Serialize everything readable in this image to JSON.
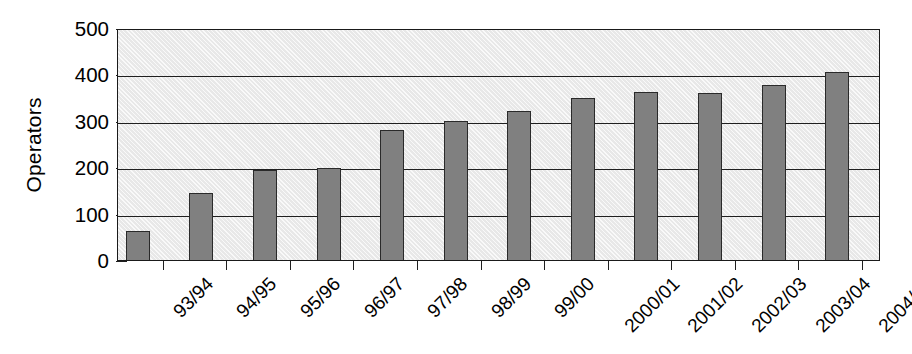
{
  "chart_data": {
    "type": "bar",
    "title": "",
    "subtitle": "",
    "xlabel": "",
    "ylabel": "Operators",
    "categories": [
      "93/94",
      "94/95",
      "95/96",
      "96/97",
      "97/98",
      "98/99",
      "99/00",
      "2000/01",
      "2001/02",
      "2002/03",
      "2003/04",
      "2004/05"
    ],
    "values": [
      63,
      145,
      195,
      199,
      280,
      300,
      322,
      350,
      362,
      361,
      378,
      405
    ],
    "series": [
      {
        "name": "Operators",
        "values": [
          63,
          145,
          195,
          199,
          280,
          300,
          322,
          350,
          362,
          361,
          378,
          405
        ]
      }
    ],
    "ylim": [
      0,
      500
    ],
    "yticks": [
      0,
      100,
      200,
      300,
      400,
      500
    ],
    "ytick_labels": [
      "0",
      "100",
      "200",
      "300",
      "400",
      "500"
    ],
    "gridlines": [
      100,
      200,
      300,
      400
    ],
    "grid": true,
    "legend": false,
    "legend_position": "none",
    "bar_color": "#808080",
    "bar_edge_color": "#2a2a2a",
    "plot_background_color": "#e8e8e8",
    "axis_color": "#1f1f1f",
    "annotations": []
  }
}
